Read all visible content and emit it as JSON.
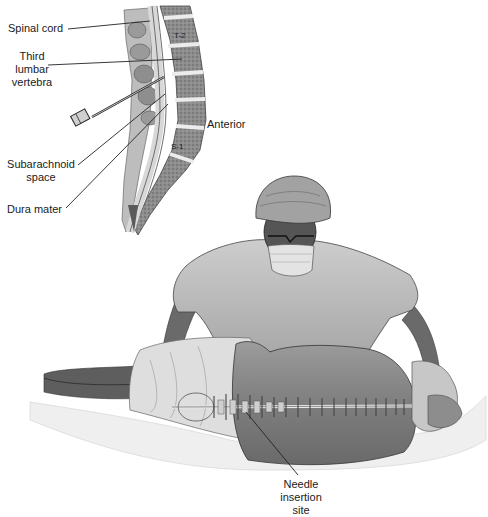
{
  "diagram": {
    "inset": {
      "title": "Sagittal section of lumbar spine",
      "labels": {
        "spinal_cord": "Spinal cord",
        "third_lumbar": [
          "Third",
          "lumbar",
          "vertebra"
        ],
        "subarachnoid": [
          "Subarachnoid",
          "space"
        ],
        "dura_mater": "Dura mater",
        "anterior": "Anterior",
        "t2": "T-2",
        "s1": "S-1"
      }
    },
    "main": {
      "labels": {
        "needle_site": [
          "Needle",
          "insertion",
          "site"
        ]
      }
    },
    "colors": {
      "background": "#ffffff",
      "text": "#1a1a1a",
      "leader": "#222222",
      "bone": "#9a9a9a",
      "disc": "#e6e6e6",
      "cord": "#cfcfcf",
      "skin": "#8a8a8a",
      "gown": "#c4c4c4",
      "sheet": "#f2f2f2"
    }
  }
}
